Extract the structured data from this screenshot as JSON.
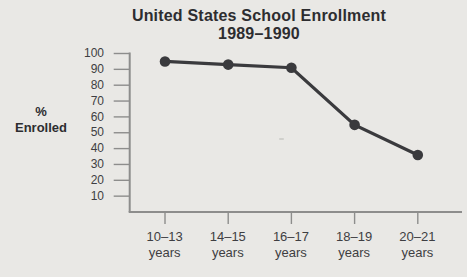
{
  "chart_data": {
    "type": "line",
    "title": "United States School Enrollment",
    "subtitle": "1989–1990",
    "ylabel": "% Enrolled",
    "ylabel_lines": [
      "%",
      "Enrolled"
    ],
    "categories": [
      "10–13 years",
      "14–15 years",
      "16–17 years",
      "18–19 years",
      "20–21 years"
    ],
    "x_labels": [
      {
        "range": "10–13",
        "unit": "years"
      },
      {
        "range": "14–15",
        "unit": "years"
      },
      {
        "range": "16–17",
        "unit": "years"
      },
      {
        "range": "18–19",
        "unit": "years"
      },
      {
        "range": "20–21",
        "unit": "years"
      }
    ],
    "values": [
      95,
      93,
      91,
      55,
      36
    ],
    "yticks": [
      100,
      90,
      80,
      70,
      60,
      50,
      40,
      30,
      20,
      10
    ],
    "ylim": [
      0,
      100
    ],
    "grid": false,
    "legend": "none",
    "colors": {
      "background": "#e9e8e5",
      "line": "#3a3a3d",
      "point": "#3a3a3d",
      "axis": "#8d8d8c",
      "title_text": "#2d2d30",
      "tick_text": "#3e3e42"
    }
  }
}
